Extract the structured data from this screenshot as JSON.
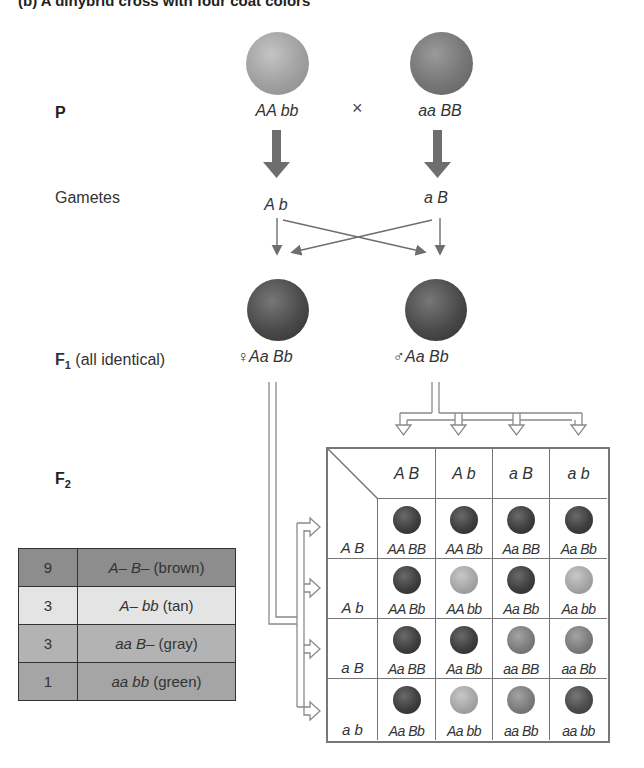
{
  "title": "(b) A dihybrid cross with four coat colors",
  "colors": {
    "tan": "#a7a7a7",
    "gray": "#7d7d7d",
    "brown": "#505050",
    "green": "#5a5a5a",
    "arrow": "#6e6e6e",
    "row_brown": "#8d8d8d",
    "row_tan": "#e4e4e4",
    "row_gray": "#b3b3b3",
    "row_green": "#a5a5a5"
  },
  "labels": {
    "p": "P",
    "gametes": "Gametes",
    "f1_main": "F",
    "f1_sub": "1",
    "f1_note": " (all identical)",
    "f2_main": "F",
    "f2_sub": "2"
  },
  "parents": {
    "left": {
      "genotype": "AA bb",
      "phenotype": "tan"
    },
    "cross_symbol": "×",
    "right": {
      "genotype": "aa BB",
      "phenotype": "gray"
    }
  },
  "gametes": {
    "left": "A b",
    "right": "a B"
  },
  "f1": {
    "female": {
      "symbol": "♀",
      "genotype": "Aa Bb",
      "phenotype": "brown"
    },
    "male": {
      "symbol": "♂",
      "genotype": "Aa Bb",
      "phenotype": "brown"
    }
  },
  "punnett": {
    "col_headers": [
      "A B",
      "A b",
      "a B",
      "a b"
    ],
    "row_headers": [
      "A B",
      "A b",
      "a B",
      "a b"
    ],
    "cells": [
      [
        {
          "g": "AA BB",
          "p": "brown"
        },
        {
          "g": "AA Bb",
          "p": "brown"
        },
        {
          "g": "Aa BB",
          "p": "brown"
        },
        {
          "g": "Aa Bb",
          "p": "brown"
        }
      ],
      [
        {
          "g": "AA Bb",
          "p": "brown"
        },
        {
          "g": "AA bb",
          "p": "tan"
        },
        {
          "g": "Aa Bb",
          "p": "brown"
        },
        {
          "g": "Aa bb",
          "p": "tan"
        }
      ],
      [
        {
          "g": "Aa BB",
          "p": "brown"
        },
        {
          "g": "Aa Bb",
          "p": "brown"
        },
        {
          "g": "aa BB",
          "p": "gray"
        },
        {
          "g": "aa Bb",
          "p": "gray"
        }
      ],
      [
        {
          "g": "Aa Bb",
          "p": "brown"
        },
        {
          "g": "Aa bb",
          "p": "tan"
        },
        {
          "g": "aa Bb",
          "p": "gray"
        },
        {
          "g": "aa bb",
          "p": "green"
        }
      ]
    ]
  },
  "ratio_table": [
    {
      "count": "9",
      "genotype": "A– B–",
      "phenotype": " (brown)"
    },
    {
      "count": "3",
      "genotype": "A– bb",
      "phenotype": " (tan)"
    },
    {
      "count": "3",
      "genotype": "aa B–",
      "phenotype": " (gray)"
    },
    {
      "count": "1",
      "genotype": "aa bb",
      "phenotype": " (green)"
    }
  ]
}
